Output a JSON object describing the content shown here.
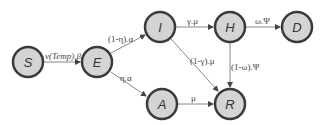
{
  "diagram": {
    "type": "compartmental-model",
    "nodes": [
      {
        "id": "S",
        "label": "S",
        "x": 28,
        "y": 62
      },
      {
        "id": "E",
        "label": "E",
        "x": 97,
        "y": 62
      },
      {
        "id": "I",
        "label": "I",
        "x": 160,
        "y": 27
      },
      {
        "id": "H",
        "label": "H",
        "x": 230,
        "y": 27
      },
      {
        "id": "D",
        "label": "D",
        "x": 297,
        "y": 27
      },
      {
        "id": "A",
        "label": "A",
        "x": 162,
        "y": 104
      },
      {
        "id": "R",
        "label": "R",
        "x": 230,
        "y": 104
      }
    ],
    "edges": [
      {
        "from": "S",
        "to": "E",
        "label": "ν(Temp).β"
      },
      {
        "from": "E",
        "to": "I",
        "label": "(1-η).α"
      },
      {
        "from": "E",
        "to": "A",
        "label": "η.α"
      },
      {
        "from": "I",
        "to": "H",
        "label": "γ.μ"
      },
      {
        "from": "I",
        "to": "R",
        "label": "(1-γ).μ"
      },
      {
        "from": "H",
        "to": "D",
        "label": "ω.Ψ"
      },
      {
        "from": "H",
        "to": "R",
        "label": "(1-ω).Ψ"
      },
      {
        "from": "A",
        "to": "R",
        "label": "μ"
      }
    ]
  }
}
